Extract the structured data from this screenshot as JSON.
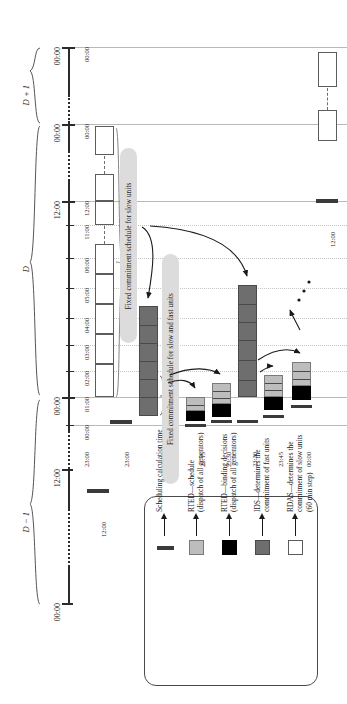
{
  "figure": {
    "type": "timeline-schedule-diagram",
    "orientation": "rotated-90-ccw"
  },
  "day_braces": [
    {
      "label": "D + 1"
    },
    {
      "label": "D"
    },
    {
      "label": "D − 1"
    }
  ],
  "outer_axis_labels": [
    "00:00",
    "00:00",
    "12:00",
    "00:00",
    "12:00",
    "00:00"
  ],
  "inner_axis_labels": [
    "00:00",
    "00:00",
    "12:00",
    "11:00",
    "06:00",
    "05:00",
    "04:00",
    "03:00",
    "02:00",
    "01:00",
    "00:00",
    "23:00"
  ],
  "run_time_labels": [
    "12:00",
    "23:00",
    "23:15",
    "23:30",
    "23:30",
    "23:45",
    "00:00",
    "12:00"
  ],
  "pills": [
    {
      "text": "Fixed commitment schedule for slow units"
    },
    {
      "text": "Fixed commitment schedule for slow and fast units"
    }
  ],
  "legend": {
    "items": [
      {
        "swatch": "white",
        "text": "RDAS—determines the\ncommitment of slow units\n(60 min step)"
      },
      {
        "swatch": "grey",
        "text": "IDS—determines the\ncommitment of fast units"
      },
      {
        "swatch": "black",
        "text": "RTED—binding decisions\n(dispatch of all generators)"
      },
      {
        "swatch": "lgrey",
        "text": "RTED—schedule\n(dispatch of all generators)"
      },
      {
        "swatch": "bar",
        "text": "Scheduling calculation time"
      }
    ]
  },
  "colors": {
    "white": "#ffffff",
    "grey": "#6e6e6e",
    "black": "#000000",
    "light_grey": "#bdbdbd",
    "calc_bar": "#3a3a3a",
    "gridline": "#b9b9b9",
    "pill_bg": "#dcdcdc"
  }
}
